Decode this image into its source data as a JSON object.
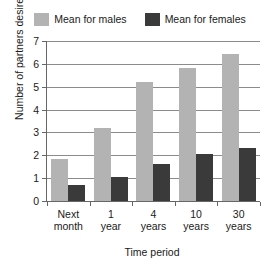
{
  "chart_data": {
    "type": "bar",
    "title": "",
    "xlabel": "Time period",
    "ylabel": "Number of partners desired",
    "categories": [
      "Next month",
      "1 year",
      "4 years",
      "10 years",
      "30 years"
    ],
    "category_lines": [
      [
        "Next",
        "month"
      ],
      [
        "1",
        "year"
      ],
      [
        "4",
        "years"
      ],
      [
        "10",
        "years"
      ],
      [
        "30",
        "years"
      ]
    ],
    "series": [
      {
        "name": "Mean for males",
        "color": "#b3b3b3",
        "values": [
          1.85,
          3.2,
          5.2,
          5.8,
          6.45
        ]
      },
      {
        "name": "Mean for females",
        "color": "#3a3a3a",
        "values": [
          0.7,
          1.05,
          1.6,
          2.05,
          2.3
        ]
      }
    ],
    "ylim": [
      0,
      7
    ],
    "yticks": [
      0,
      1,
      2,
      3,
      4,
      5,
      6,
      7
    ],
    "ytick_labels": [
      "0",
      "1",
      "2",
      "3",
      "4",
      "5",
      "6",
      "7"
    ],
    "grid": true,
    "legend_position": "top"
  },
  "legend": {
    "entries": [
      {
        "label": "Mean for males",
        "color": "#b3b3b3"
      },
      {
        "label": "Mean for females",
        "color": "#3a3a3a"
      }
    ]
  },
  "colors": {
    "males": "#b3b3b3",
    "females": "#3a3a3a",
    "gridline": "#8c8c8c",
    "axis": "#666666",
    "text": "#1a1a1a",
    "background": "#ffffff"
  }
}
